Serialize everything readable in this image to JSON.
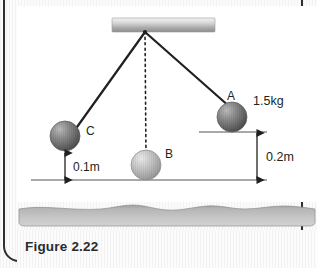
{
  "caption": {
    "label": "Figure 2.22"
  },
  "figure": {
    "support": {
      "name": "ceiling-support-bar"
    },
    "pivot": {
      "x": 145,
      "y": 26
    },
    "balls": [
      {
        "id": "A",
        "label": "A",
        "cx": 231,
        "cy": 117,
        "r": 15,
        "shade": "dark",
        "mass_label": "1.5kg"
      },
      {
        "id": "B",
        "label": "B",
        "cx": 147,
        "cy": 165,
        "r": 15,
        "shade": "light",
        "mass_label": ""
      },
      {
        "id": "C",
        "label": "C",
        "cx": 64,
        "cy": 136,
        "r": 15,
        "shade": "dark",
        "mass_label": ""
      }
    ],
    "dimensions": [
      {
        "id": "height-C",
        "label": "0.1m",
        "value": 0.1,
        "unit": "m"
      },
      {
        "id": "height-A",
        "label": "0.2m",
        "value": 0.2,
        "unit": "m"
      }
    ],
    "strings": [
      {
        "from": "pivot",
        "to": "C",
        "style": "solid"
      },
      {
        "from": "pivot",
        "to": "A",
        "style": "solid"
      },
      {
        "from": "pivot",
        "to": "B",
        "style": "dotted"
      }
    ],
    "baseline": {
      "y": 180,
      "x1": 30,
      "x2": 265
    },
    "reference_line_A": {
      "y": 132,
      "x1": 198,
      "x2": 265
    }
  },
  "colors": {
    "ball_dark": "#6e6e6e",
    "ball_light": "#b4b4b4",
    "line": "#231f20",
    "rule_gray": "#b0b0b0",
    "page_border": "#2d2f31",
    "caption_text": "#2b2b2b"
  }
}
